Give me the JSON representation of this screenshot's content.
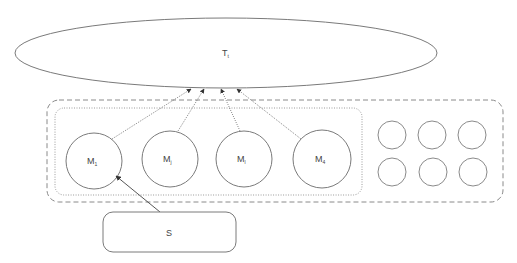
{
  "diagram": {
    "target": {
      "label": "T",
      "subscript": "t"
    },
    "models": [
      {
        "label": "M",
        "subscript": "1"
      },
      {
        "label": "M",
        "subscript": "j"
      },
      {
        "label": "M",
        "subscript": "l"
      },
      {
        "label": "M",
        "subscript": "4"
      }
    ],
    "pool_circle_count": 6,
    "source": {
      "label": "S"
    },
    "colors": {
      "stroke": "#7a7a7a",
      "dashed_stroke": "#8a8a8a",
      "arrow": "#555555",
      "text": "#444444"
    }
  }
}
